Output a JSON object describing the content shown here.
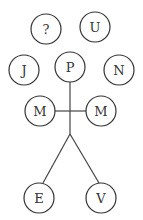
{
  "diagram": {
    "nodes": [
      {
        "id": "q",
        "label": "?",
        "cx": 46,
        "cy": 29
      },
      {
        "id": "u",
        "label": "U",
        "cx": 95,
        "cy": 27
      },
      {
        "id": "j",
        "label": "J",
        "cx": 24,
        "cy": 70
      },
      {
        "id": "p",
        "label": "P",
        "cx": 70,
        "cy": 67
      },
      {
        "id": "n",
        "label": "N",
        "cx": 119,
        "cy": 70
      },
      {
        "id": "m1",
        "label": "M",
        "cx": 40,
        "cy": 111
      },
      {
        "id": "m2",
        "label": "M",
        "cx": 101,
        "cy": 111
      },
      {
        "id": "e",
        "label": "E",
        "cx": 39,
        "cy": 198
      },
      {
        "id": "v",
        "label": "V",
        "cx": 101,
        "cy": 198
      }
    ],
    "radius": 15
  }
}
